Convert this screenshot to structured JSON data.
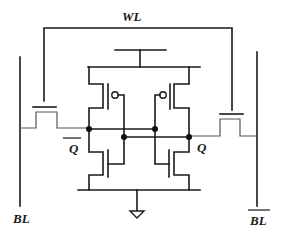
{
  "diagram": {
    "type": "circuit-schematic",
    "labels": {
      "word_line": "WL",
      "bit_line": "BL",
      "bit_line_bar": "BL",
      "node_q_bar": "Q",
      "node_q": "Q"
    },
    "overbars": {
      "bit_line_bar": true,
      "node_q_bar": true
    },
    "components": [
      {
        "id": "left-access-nmos",
        "kind": "nmos",
        "connects": [
          "BL",
          "Q_bar"
        ],
        "gate": "WL"
      },
      {
        "id": "right-access-nmos",
        "kind": "nmos",
        "connects": [
          "Q",
          "BL_bar"
        ],
        "gate": "WL"
      },
      {
        "id": "left-pull-up-pmos",
        "kind": "pmos",
        "connects": [
          "VDD",
          "Q_bar"
        ],
        "gate": "Q"
      },
      {
        "id": "right-pull-up-pmos",
        "kind": "pmos",
        "connects": [
          "VDD",
          "Q"
        ],
        "gate": "Q_bar"
      },
      {
        "id": "left-pull-down-nmos",
        "kind": "nmos",
        "connects": [
          "Q_bar",
          "GND"
        ],
        "gate": "Q"
      },
      {
        "id": "right-pull-down-nmos",
        "kind": "nmos",
        "connects": [
          "Q",
          "GND"
        ],
        "gate": "Q_bar"
      }
    ],
    "supplies": [
      "VDD",
      "GND"
    ],
    "colors": {
      "wire": "#1a1a1a",
      "background": "#ffffff"
    }
  }
}
